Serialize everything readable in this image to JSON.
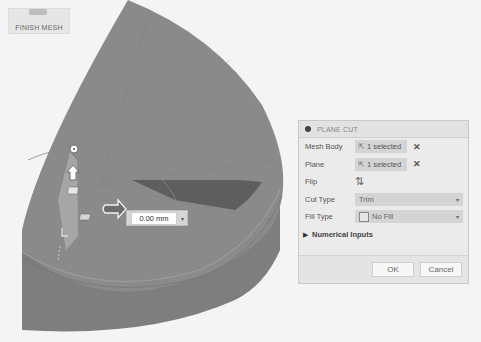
{
  "toolbar": {
    "finish_mesh_label": "FINISH MESH",
    "finish_mesh_icon": "finish-mesh-icon"
  },
  "viewport": {
    "distance_value": "0.00 mm",
    "distance_dropdown_caret": "▾",
    "colors": {
      "background": "#f4f4f4",
      "mesh_top": "#8a8a8a",
      "mesh_side": "#7e7e7e",
      "mesh_cut_shadow": "#5e5e5e",
      "manipulator_arc": "#9a9a9a"
    }
  },
  "dialog": {
    "title": "PLANE CUT",
    "rows": [
      {
        "label": "Mesh Body",
        "value": "1 selected",
        "clear": "✕"
      },
      {
        "label": "Plane",
        "value": "1 selected",
        "clear": "✕"
      },
      {
        "label": "Flip",
        "icon": "flip-icon"
      },
      {
        "label": "Cut Type",
        "value": "Trim",
        "caret": "▾"
      },
      {
        "label": "Fill Type",
        "value": "No Fill",
        "caret": "▾"
      }
    ],
    "numerical_inputs_label": "Numerical Inputs",
    "ok_label": "OK",
    "cancel_label": "Cancel"
  }
}
